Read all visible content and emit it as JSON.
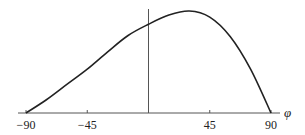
{
  "chart_data": {
    "type": "line",
    "title": "",
    "xlabel": "φ",
    "ylabel": "",
    "xlim": [
      -90,
      90
    ],
    "x_ticks": [
      -90,
      -45,
      45,
      90
    ],
    "x_tick_labels": [
      "−90",
      "−45",
      "45",
      "90"
    ],
    "grid": false,
    "legend": null,
    "series": [
      {
        "name": "curve",
        "x": [
          -90,
          -75,
          -60,
          -45,
          -30,
          -15,
          0,
          15,
          30,
          45,
          60,
          75,
          90
        ],
        "y": [
          0.0,
          0.13,
          0.28,
          0.43,
          0.6,
          0.76,
          0.87,
          0.96,
          1.0,
          0.94,
          0.75,
          0.43,
          0.0
        ]
      }
    ],
    "ylim": [
      0,
      1.05
    ]
  },
  "axes": {
    "x_label": "φ",
    "ticks": [
      "−90",
      "−45",
      "45",
      "90"
    ]
  }
}
